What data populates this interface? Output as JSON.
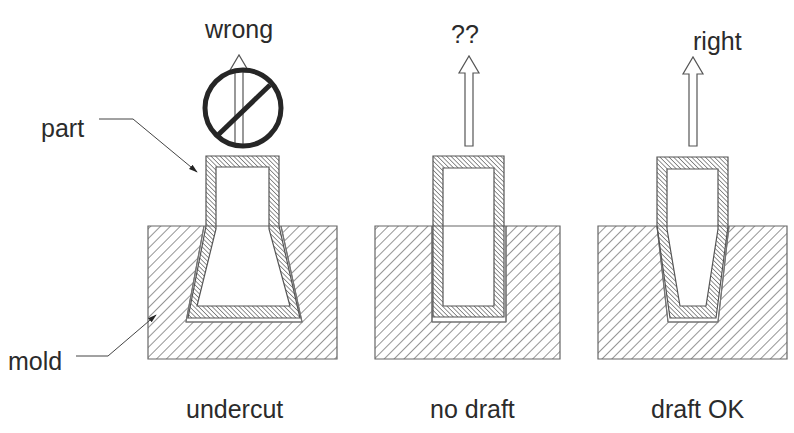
{
  "labels": {
    "part": "part",
    "mold": "mold"
  },
  "panels": [
    {
      "id": "undercut",
      "caption": "undercut",
      "top_label": "wrong",
      "prohibited": true,
      "description": "Part with undercut: walls flare outward inside the mold, cannot be ejected"
    },
    {
      "id": "no-draft",
      "caption": "no draft",
      "top_label": "??",
      "prohibited": false,
      "description": "Part with straight vertical walls, no draft angle"
    },
    {
      "id": "draft-ok",
      "caption": "draft OK",
      "top_label": "right",
      "prohibited": false,
      "description": "Part with walls tapering inward, proper draft angle"
    }
  ],
  "colors": {
    "stroke": "#555555",
    "text": "#2b2b2b",
    "hatch": "#555555",
    "prohibit": "#262626",
    "background": "#ffffff"
  }
}
